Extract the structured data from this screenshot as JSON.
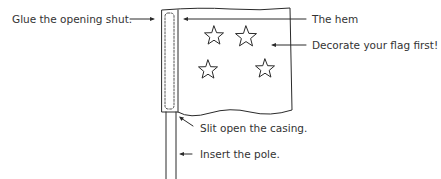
{
  "diagram": {
    "labels": {
      "glue": "Glue the opening shut.",
      "hem": "The hem",
      "decorate": "Decorate your flag first!",
      "slit": "Slit open the casing.",
      "insert": "Insert the pole."
    },
    "icons": {
      "star_count": 4,
      "arrow_count": 5
    },
    "colors": {
      "line": "#2a2a2a",
      "background": "#ffffff"
    }
  }
}
